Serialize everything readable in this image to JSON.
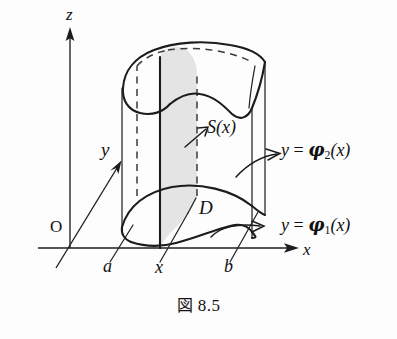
{
  "figure": {
    "caption": "図 8.5",
    "caption_label": "図",
    "caption_number": "8.5",
    "background_color": "#fdfdfd",
    "ink_color": "#1c1c1c",
    "slice_fill_color": "#e4e4e4"
  },
  "axes": {
    "z": {
      "label": "z",
      "direction": "up"
    },
    "y": {
      "label": "y",
      "direction": "up-right-diagonal"
    },
    "x": {
      "label": "x",
      "direction": "right"
    },
    "origin": {
      "label": "O"
    }
  },
  "ticks": {
    "a": "a",
    "x": "x",
    "b": "b"
  },
  "annotations": {
    "cross_section": "S(x)",
    "region": "D",
    "upper_boundary": "y = φ₂(x)",
    "lower_boundary": "y = φ₁(x)",
    "upper_boundary_lhs": "y",
    "upper_boundary_eq": "=",
    "upper_boundary_fn": "φ",
    "upper_boundary_sub": "2",
    "upper_boundary_arg": "(x)",
    "lower_boundary_lhs": "y",
    "lower_boundary_eq": "=",
    "lower_boundary_fn": "φ",
    "lower_boundary_sub": "1",
    "lower_boundary_arg": "(x)",
    "cross_section_fn": "S",
    "cross_section_arg": "(x)"
  }
}
